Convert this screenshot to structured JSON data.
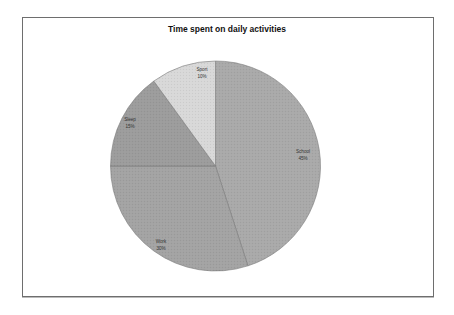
{
  "chart_data": {
    "type": "pie",
    "title": "Time spent on daily activities",
    "categories": [
      "School",
      "Work",
      "Sleep",
      "Sport"
    ],
    "values": [
      45,
      30,
      15,
      10
    ],
    "labels": [
      "School\n45%",
      "Work\n30%",
      "Sleep\n15%",
      "Sport\n10%"
    ],
    "colors": [
      "#a9a9a9",
      "#a3a3a3",
      "#9c9c9c",
      "#d8d8d8"
    ],
    "start_angle_deg": 0,
    "direction": "clockwise",
    "legend": "none",
    "data_labels": "category name and percentage inside slices"
  },
  "slices": [
    {
      "name": "School",
      "pct": "45%"
    },
    {
      "name": "Work",
      "pct": "30%"
    },
    {
      "name": "Sleep",
      "pct": "15%"
    },
    {
      "name": "Sport",
      "pct": "10%"
    }
  ]
}
